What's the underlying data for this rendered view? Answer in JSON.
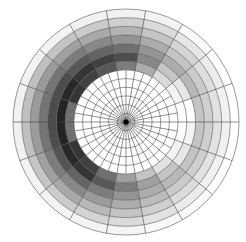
{
  "chart_data": {
    "type": "heatmap",
    "subtype": "polar",
    "title": "",
    "xlabel": "",
    "ylabel": "",
    "grid": true,
    "legend": null,
    "geometry": {
      "center": [
        126,
        122
      ],
      "outer_radius": 113,
      "ring_count": 13,
      "inner_sector_count": 36,
      "outer_sector_count": 18,
      "outer_zone_starts_at_ring": 6
    },
    "angle_unit": "degrees, counterclockwise from east",
    "sector_centers_deg": [
      10,
      30,
      50,
      70,
      90,
      110,
      130,
      150,
      170,
      190,
      210,
      230,
      250,
      270,
      290,
      310,
      330,
      350
    ],
    "rings": [
      "r7",
      "r8",
      "r9",
      "r10",
      "r11",
      "r12",
      "r13"
    ],
    "values": [
      [
        0.0,
        0.05,
        0.15,
        0.35,
        0.55,
        0.7,
        0.8,
        0.85,
        0.6,
        0.6,
        0.85,
        0.8,
        0.6,
        0.4,
        0.25,
        0.12,
        0.05,
        0.0
      ],
      [
        0.0,
        0.1,
        0.25,
        0.5,
        0.75,
        0.8,
        0.85,
        0.9,
        0.92,
        0.92,
        0.9,
        0.85,
        0.7,
        0.55,
        0.4,
        0.25,
        0.1,
        0.05
      ],
      [
        0.25,
        0.3,
        0.35,
        0.45,
        0.6,
        0.65,
        0.7,
        0.75,
        0.75,
        0.75,
        0.72,
        0.65,
        0.55,
        0.45,
        0.35,
        0.3,
        0.25,
        0.25
      ],
      [
        0.2,
        0.22,
        0.25,
        0.35,
        0.45,
        0.5,
        0.55,
        0.58,
        0.58,
        0.58,
        0.55,
        0.5,
        0.42,
        0.35,
        0.28,
        0.22,
        0.2,
        0.2
      ],
      [
        0.12,
        0.14,
        0.18,
        0.25,
        0.32,
        0.36,
        0.4,
        0.42,
        0.42,
        0.42,
        0.4,
        0.36,
        0.3,
        0.25,
        0.2,
        0.15,
        0.12,
        0.12
      ],
      [
        0.06,
        0.08,
        0.1,
        0.15,
        0.2,
        0.22,
        0.25,
        0.27,
        0.27,
        0.27,
        0.25,
        0.22,
        0.18,
        0.15,
        0.12,
        0.08,
        0.06,
        0.06
      ],
      [
        0.0,
        0.0,
        0.02,
        0.05,
        0.06,
        0.06,
        0.05,
        0.06,
        0.06,
        0.06,
        0.05,
        0.05,
        0.05,
        0.04,
        0.03,
        0.02,
        0.0,
        0.0
      ]
    ],
    "value_range": [
      0,
      1
    ],
    "colormap": "white-to-black grayscale",
    "colors": {
      "low": "#ffffff",
      "high": "#111111",
      "grid": "#555555",
      "center_dot": "#000000"
    }
  }
}
